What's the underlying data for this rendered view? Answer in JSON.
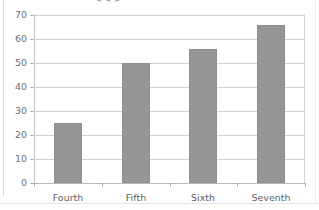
{
  "figure": {
    "cropped_title_fragment": "g g   p",
    "accent_color": "#969696",
    "gridline_color": "#d2d2d2",
    "axis_color": "#c3c3c3",
    "label_color": "#6f6f6f",
    "background": "#ffffff"
  },
  "chart_data": {
    "type": "bar",
    "title": "",
    "subtitle": "",
    "xlabel": "",
    "ylabel": "",
    "categories": [
      "Fourth",
      "Fifth",
      "Sixth",
      "Seventh"
    ],
    "values": [
      25,
      50,
      56,
      66
    ],
    "ylim": [
      0,
      70
    ],
    "ytick_values": [
      0,
      10,
      20,
      30,
      40,
      50,
      60,
      70
    ],
    "ytick_labels": [
      "0",
      "10",
      "20",
      "30",
      "40",
      "50",
      "60",
      "70"
    ],
    "grid": "horizontal",
    "legend": "none",
    "series": [
      {
        "name": "",
        "color": "#969696",
        "values": [
          25,
          50,
          56,
          66
        ]
      }
    ],
    "annotations": []
  }
}
